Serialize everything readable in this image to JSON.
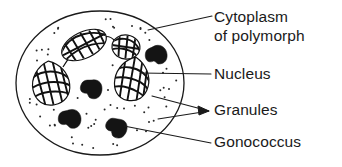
{
  "figure": {
    "type": "biological-diagram",
    "background_color": "#ffffff",
    "ink_color": "#1a1a1a"
  },
  "labels": [
    {
      "id": "cytoplasm",
      "line1": "Cytoplasm",
      "line2": "of polymorph",
      "text_x": 214,
      "line1_y": 22,
      "line2_y": 41,
      "leader": "M 148 30 L 212 16",
      "target": "cell-membrane-edge"
    },
    {
      "id": "nucleus",
      "line1": "Nucleus",
      "line2": "",
      "text_x": 214,
      "line1_y": 79,
      "line2_y": 0,
      "leader": "M 140 73 L 211 74",
      "target": "nucleus-lobe-right-lower"
    },
    {
      "id": "granules",
      "line1": "Granules",
      "line2": "",
      "text_x": 214,
      "line1_y": 115,
      "line2_y": 0,
      "leader": "M 152 96 L 209 111 M 158 119 L 209 111",
      "arrowhead": "M 209 111 L 198 106 L 199 115 Z",
      "target": "cytoplasmic-granules"
    },
    {
      "id": "gonococcus",
      "line1": "Gonococcus",
      "line2": "",
      "text_x": 214,
      "line1_y": 147,
      "line2_y": 0,
      "leader": "M 124 126 L 211 143",
      "target": "gonococcus-lower-centre"
    }
  ],
  "cell": {
    "name": "polymorph-cell",
    "outline_cx": 100,
    "outline_cy": 83,
    "outline_rx": 84,
    "outline_ry": 72
  },
  "nucleus": {
    "name": "multi-lobed-nucleus",
    "lobe_count": 4,
    "lobes": [
      {
        "id": "lobe-upper-left",
        "cx": 84,
        "cy": 45,
        "rx": 24,
        "ry": 13,
        "rotate": -26
      },
      {
        "id": "lobe-upper-right",
        "cx": 126,
        "cy": 47,
        "rx": 14,
        "ry": 12,
        "rotate": 8
      },
      {
        "id": "lobe-left",
        "cx": 51,
        "cy": 83,
        "rx": 18,
        "ry": 20,
        "rotate": -12
      },
      {
        "id": "lobe-right",
        "cx": 133,
        "cy": 80,
        "rx": 17,
        "ry": 19,
        "rotate": 10
      }
    ],
    "bridges": [
      "M 62 66 L 70 55",
      "M 100 38 L 116 42",
      "M 130 58 L 136 66"
    ]
  },
  "gonococci": {
    "name": "intracellular-gonococci",
    "count": 4,
    "items": [
      {
        "id": "gono-upper-right",
        "cx": 157,
        "cy": 55
      },
      {
        "id": "gono-centre",
        "cx": 92,
        "cy": 89
      },
      {
        "id": "gono-lower-left",
        "cx": 70,
        "cy": 119
      },
      {
        "id": "gono-lower-mid",
        "cx": 117,
        "cy": 128
      }
    ]
  },
  "granules": {
    "name": "cytoplasmic-granules",
    "description": "fine stippled dots filling the cytoplasm",
    "dot_radius": 1.0,
    "count": 58
  },
  "accessibility": {
    "alt": "Line drawing of a polymorph cell. The multi-lobed nucleus is shown as four connected reticulated lobes, four dark gonococci lie inside the cytoplasm, and fine dots represent granules. Leader lines label Cytoplasm of polymorph, Nucleus, Granules and Gonococcus."
  }
}
